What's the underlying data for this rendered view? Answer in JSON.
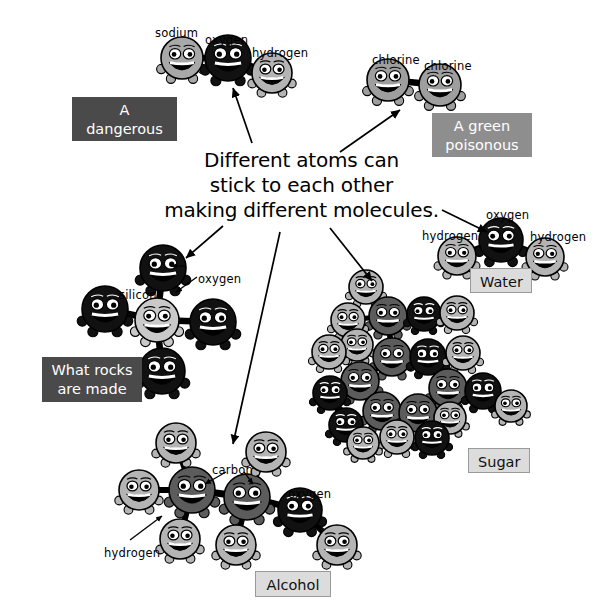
{
  "headline": {
    "line1": "Different atoms can",
    "line2": "stick to each other",
    "line3": "making different molecules."
  },
  "tags": [
    {
      "name": "dangerous-chemical",
      "text": "A dangerous\nchemical",
      "style": "tag-dark",
      "x": 72,
      "y": 97,
      "w": 105,
      "h": 44
    },
    {
      "name": "green-poisonous-gas",
      "text": "A green\npoisonous gas",
      "style": "tag-mid",
      "x": 432,
      "y": 113,
      "w": 100,
      "h": 44
    },
    {
      "name": "water",
      "text": "Water",
      "style": "tag-light",
      "x": 470,
      "y": 268,
      "w": 62,
      "h": 25
    },
    {
      "name": "what-rocks-are-made-of",
      "text": "What rocks\nare made of",
      "style": "tag-dark",
      "x": 42,
      "y": 357,
      "w": 100,
      "h": 45
    },
    {
      "name": "sugar",
      "text": "Sugar",
      "style": "tag-light",
      "x": 468,
      "y": 448,
      "w": 62,
      "h": 25
    },
    {
      "name": "alcohol",
      "text": "Alcohol",
      "style": "tag-light",
      "x": 255,
      "y": 571,
      "w": 76,
      "h": 26
    }
  ],
  "atom_labels": [
    {
      "name": "sodium-label-nacl",
      "text": "sodium",
      "x": 155,
      "y": 26
    },
    {
      "name": "oxygen-label-nacl",
      "text": "oxygen",
      "x": 205,
      "y": 33
    },
    {
      "name": "hydrogen-label-nacl",
      "text": "hydrogen",
      "x": 252,
      "y": 46
    },
    {
      "name": "chlorine-label-left",
      "text": "chlorine",
      "x": 372,
      "y": 53
    },
    {
      "name": "chlorine-label-right",
      "text": "chlorine",
      "x": 424,
      "y": 59
    },
    {
      "name": "oxygen-label-water",
      "text": "oxygen",
      "x": 486,
      "y": 208
    },
    {
      "name": "hydrogen-label-water-left",
      "text": "hydrogen",
      "x": 422,
      "y": 229
    },
    {
      "name": "hydrogen-label-water-right",
      "text": "hydrogen",
      "x": 530,
      "y": 230
    },
    {
      "name": "oxygen-label-silica",
      "text": "oxygen",
      "x": 198,
      "y": 272
    },
    {
      "name": "silicon-label-silica",
      "text": "silicon",
      "x": 119,
      "y": 288
    },
    {
      "name": "carbon-label-alcohol",
      "text": "carbon",
      "x": 212,
      "y": 463
    },
    {
      "name": "oxygen-label-alcohol",
      "text": "oxygen",
      "x": 288,
      "y": 487
    },
    {
      "name": "hydrogen-label-alcohol",
      "text": "hydrogen",
      "x": 104,
      "y": 546
    }
  ],
  "colors": {
    "oxygen": "#111111",
    "carbon": "#5c5c5c",
    "hydrogen": "#b4b4b4",
    "silicon": "#c9c9c9",
    "sodium": "#a8a8a8",
    "chlorine": "#9e9e9e",
    "outline": "#000000",
    "background": "#ffffff"
  },
  "molecules": [
    {
      "name": "sodium-hydroxide",
      "caption": "A dangerous chemical",
      "atoms": [
        {
          "element": "sodium",
          "shade": "sodium",
          "cx": 182,
          "cy": 58,
          "r": 21
        },
        {
          "element": "oxygen",
          "shade": "oxygen",
          "cx": 228,
          "cy": 58,
          "r": 23
        },
        {
          "element": "hydrogen",
          "shade": "hydrogen",
          "cx": 272,
          "cy": 73,
          "r": 20
        }
      ],
      "bonds": [
        [
          0,
          1
        ],
        [
          1,
          2
        ]
      ]
    },
    {
      "name": "chlorine-gas",
      "caption": "A green poisonous gas",
      "atoms": [
        {
          "element": "chlorine",
          "shade": "chlorine",
          "cx": 388,
          "cy": 80,
          "r": 21
        },
        {
          "element": "chlorine",
          "shade": "chlorine",
          "cx": 440,
          "cy": 85,
          "r": 21
        }
      ],
      "bonds": [
        [
          0,
          1
        ]
      ]
    },
    {
      "name": "water",
      "caption": "Water",
      "atoms": [
        {
          "element": "oxygen",
          "shade": "oxygen",
          "cx": 501,
          "cy": 240,
          "r": 22
        },
        {
          "element": "hydrogen",
          "shade": "hydrogen",
          "cx": 457,
          "cy": 256,
          "r": 19
        },
        {
          "element": "hydrogen",
          "shade": "hydrogen",
          "cx": 545,
          "cy": 257,
          "r": 19
        }
      ],
      "bonds": [
        [
          0,
          1
        ],
        [
          0,
          2
        ]
      ]
    },
    {
      "name": "silicon-dioxide",
      "caption": "What rocks are made of",
      "atoms": [
        {
          "element": "silicon",
          "shade": "silicon",
          "cx": 157,
          "cy": 320,
          "r": 22
        },
        {
          "element": "oxygen",
          "shade": "oxygen",
          "cx": 163,
          "cy": 268,
          "r": 23
        },
        {
          "element": "oxygen",
          "shade": "oxygen",
          "cx": 105,
          "cy": 309,
          "r": 23
        },
        {
          "element": "oxygen",
          "shade": "oxygen",
          "cx": 213,
          "cy": 322,
          "r": 23
        },
        {
          "element": "oxygen",
          "shade": "oxygen",
          "cx": 162,
          "cy": 371,
          "r": 23
        }
      ],
      "bonds": [
        [
          0,
          1
        ],
        [
          0,
          2
        ],
        [
          0,
          3
        ],
        [
          0,
          4
        ]
      ]
    },
    {
      "name": "sugar",
      "caption": "Sugar",
      "atoms": [
        {
          "element": "hydrogen",
          "shade": "hydrogen",
          "cx": 366,
          "cy": 287,
          "r": 17
        },
        {
          "element": "carbon",
          "shade": "carbon",
          "cx": 388,
          "cy": 316,
          "r": 19
        },
        {
          "element": "oxygen",
          "shade": "oxygen",
          "cx": 424,
          "cy": 314,
          "r": 17
        },
        {
          "element": "hydrogen",
          "shade": "hydrogen",
          "cx": 457,
          "cy": 313,
          "r": 17
        },
        {
          "element": "hydrogen",
          "shade": "hydrogen",
          "cx": 348,
          "cy": 320,
          "r": 17
        },
        {
          "element": "hydrogen",
          "shade": "hydrogen",
          "cx": 357,
          "cy": 345,
          "r": 16
        },
        {
          "element": "hydrogen",
          "shade": "hydrogen",
          "cx": 329,
          "cy": 352,
          "r": 17
        },
        {
          "element": "carbon",
          "shade": "carbon",
          "cx": 392,
          "cy": 357,
          "r": 19
        },
        {
          "element": "oxygen",
          "shade": "oxygen",
          "cx": 428,
          "cy": 357,
          "r": 18
        },
        {
          "element": "hydrogen",
          "shade": "hydrogen",
          "cx": 463,
          "cy": 353,
          "r": 17
        },
        {
          "element": "carbon",
          "shade": "carbon",
          "cx": 360,
          "cy": 381,
          "r": 19
        },
        {
          "element": "oxygen",
          "shade": "oxygen",
          "cx": 330,
          "cy": 393,
          "r": 17
        },
        {
          "element": "carbon",
          "shade": "carbon",
          "cx": 448,
          "cy": 388,
          "r": 19
        },
        {
          "element": "oxygen",
          "shade": "oxygen",
          "cx": 483,
          "cy": 391,
          "r": 18
        },
        {
          "element": "hydrogen",
          "shade": "hydrogen",
          "cx": 511,
          "cy": 406,
          "r": 16
        },
        {
          "element": "carbon",
          "shade": "carbon",
          "cx": 382,
          "cy": 411,
          "r": 19
        },
        {
          "element": "carbon",
          "shade": "carbon",
          "cx": 418,
          "cy": 413,
          "r": 19
        },
        {
          "element": "hydrogen",
          "shade": "hydrogen",
          "cx": 450,
          "cy": 418,
          "r": 16
        },
        {
          "element": "oxygen",
          "shade": "oxygen",
          "cx": 346,
          "cy": 425,
          "r": 17
        },
        {
          "element": "hydrogen",
          "shade": "hydrogen",
          "cx": 397,
          "cy": 437,
          "r": 17
        },
        {
          "element": "oxygen",
          "shade": "oxygen",
          "cx": 432,
          "cy": 438,
          "r": 17
        },
        {
          "element": "hydrogen",
          "shade": "hydrogen",
          "cx": 363,
          "cy": 443,
          "r": 16
        }
      ],
      "bonds": [
        [
          0,
          1
        ],
        [
          1,
          2
        ],
        [
          2,
          3
        ],
        [
          1,
          4
        ],
        [
          4,
          6
        ],
        [
          1,
          7
        ],
        [
          7,
          8
        ],
        [
          8,
          9
        ],
        [
          7,
          10
        ],
        [
          10,
          11
        ],
        [
          8,
          12
        ],
        [
          12,
          13
        ],
        [
          13,
          14
        ],
        [
          10,
          15
        ],
        [
          15,
          16
        ],
        [
          16,
          17
        ],
        [
          15,
          18
        ],
        [
          16,
          19
        ],
        [
          16,
          20
        ],
        [
          18,
          21
        ]
      ]
    },
    {
      "name": "alcohol",
      "caption": "Alcohol",
      "atoms": [
        {
          "element": "carbon",
          "shade": "carbon",
          "cx": 192,
          "cy": 490,
          "r": 23
        },
        {
          "element": "carbon",
          "shade": "carbon",
          "cx": 247,
          "cy": 497,
          "r": 23
        },
        {
          "element": "oxygen",
          "shade": "oxygen",
          "cx": 300,
          "cy": 510,
          "r": 22
        },
        {
          "element": "hydrogen",
          "shade": "hydrogen",
          "cx": 176,
          "cy": 443,
          "r": 20
        },
        {
          "element": "hydrogen",
          "shade": "hydrogen",
          "cx": 139,
          "cy": 490,
          "r": 20
        },
        {
          "element": "hydrogen",
          "shade": "hydrogen",
          "cx": 180,
          "cy": 539,
          "r": 20
        },
        {
          "element": "hydrogen",
          "shade": "hydrogen",
          "cx": 266,
          "cy": 452,
          "r": 20
        },
        {
          "element": "hydrogen",
          "shade": "hydrogen",
          "cx": 236,
          "cy": 545,
          "r": 20
        },
        {
          "element": "hydrogen",
          "shade": "hydrogen",
          "cx": 337,
          "cy": 545,
          "r": 20
        }
      ],
      "bonds": [
        [
          0,
          1
        ],
        [
          1,
          2
        ],
        [
          0,
          3
        ],
        [
          0,
          4
        ],
        [
          0,
          5
        ],
        [
          1,
          6
        ],
        [
          1,
          7
        ],
        [
          2,
          8
        ]
      ]
    }
  ],
  "arrows": [
    {
      "name": "arrow-to-sodium-hydroxide",
      "x1": 252,
      "y1": 143,
      "x2": 233,
      "y2": 88
    },
    {
      "name": "arrow-to-chlorine-gas",
      "x1": 340,
      "y1": 152,
      "x2": 400,
      "y2": 110
    },
    {
      "name": "arrow-to-water",
      "x1": 442,
      "y1": 210,
      "x2": 487,
      "y2": 232
    },
    {
      "name": "arrow-to-silicon-dioxide",
      "x1": 223,
      "y1": 226,
      "x2": 186,
      "y2": 258
    },
    {
      "name": "arrow-to-sugar",
      "x1": 330,
      "y1": 228,
      "x2": 372,
      "y2": 281
    },
    {
      "name": "arrow-to-alcohol",
      "x1": 280,
      "y1": 232,
      "x2": 233,
      "y2": 444
    }
  ],
  "pointer_arrows": [
    {
      "name": "pointer-oxygen-silica",
      "x1": 197,
      "y1": 277,
      "x2": 176,
      "y2": 292
    },
    {
      "name": "pointer-oxygen-silica-2",
      "x1": 186,
      "y1": 266,
      "x2": 171,
      "y2": 266
    },
    {
      "name": "pointer-carbon-left",
      "x1": 226,
      "y1": 472,
      "x2": 205,
      "y2": 484
    },
    {
      "name": "pointer-carbon-right",
      "x1": 244,
      "y1": 472,
      "x2": 253,
      "y2": 484
    },
    {
      "name": "pointer-hydrogen-alcohol",
      "x1": 130,
      "y1": 540,
      "x2": 162,
      "y2": 516
    }
  ]
}
